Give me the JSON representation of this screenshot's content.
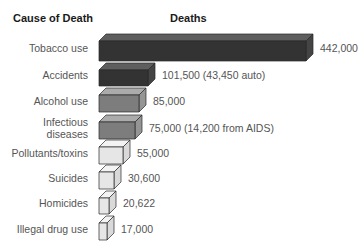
{
  "chart_data": {
    "type": "bar",
    "orientation": "horizontal",
    "style": "3d-box",
    "title": "",
    "column_headers": {
      "category": "Cause of Death",
      "value": "Deaths"
    },
    "categories": [
      "Tobacco use",
      "Accidents",
      "Alcohol use",
      "Infectious diseases",
      "Pollutants/toxins",
      "Suicides",
      "Homicides",
      "Illegal drug use"
    ],
    "values": [
      442000,
      101500,
      85000,
      75000,
      55000,
      30600,
      20622,
      17000
    ],
    "value_labels": [
      "442,000",
      "101,500 (43,450 auto)",
      "85,000",
      "75,000 (14,200 from AIDS)",
      "55,000",
      "30,600",
      "20,622",
      "17,000"
    ],
    "xlabel": "",
    "ylabel": "",
    "grid": false,
    "legend": null
  },
  "rows": [
    {
      "label_lines": [
        "Tobacco use"
      ],
      "value_label": "442,000",
      "front_x2": 306,
      "top": 41,
      "bottom": 61,
      "shade": "dark"
    },
    {
      "label_lines": [
        "Accidents"
      ],
      "value_label": "101,500 (43,450 auto)",
      "front_x2": 148,
      "top": 70,
      "bottom": 86,
      "shade": "dark"
    },
    {
      "label_lines": [
        "Alcohol use"
      ],
      "value_label": "85,000",
      "front_x2": 139,
      "top": 95,
      "bottom": 112,
      "shade": "mid"
    },
    {
      "label_lines": [
        "Infectious",
        "diseases"
      ],
      "value_label": "75,000 (14,200 from AIDS)",
      "front_x2": 135,
      "top": 122,
      "bottom": 139,
      "shade": "mid"
    },
    {
      "label_lines": [
        "Pollutants/toxins"
      ],
      "value_label": "55,000",
      "front_x2": 123,
      "top": 147,
      "bottom": 164,
      "shade": "light"
    },
    {
      "label_lines": [
        "Suicides"
      ],
      "value_label": "30,600",
      "front_x2": 114,
      "top": 172,
      "bottom": 189,
      "shade": "light"
    },
    {
      "label_lines": [
        "Homicides"
      ],
      "value_label": "20,622",
      "front_x2": 109,
      "top": 198,
      "bottom": 214,
      "shade": "light"
    },
    {
      "label_lines": [
        "Illegal drug use"
      ],
      "value_label": "17,000",
      "front_x2": 107,
      "top": 223,
      "bottom": 240,
      "shade": "light"
    }
  ],
  "colors": {
    "dark": {
      "front": "#333333",
      "top": "#5e5e5e",
      "side": "#444444"
    },
    "mid": {
      "front": "#7d7d7d",
      "top": "#ababab",
      "side": "#959595"
    },
    "light": {
      "front": "#e6e6e6",
      "top": "#f3f3f3",
      "side": "#d9d9d9"
    },
    "stroke": "#2a2a2a"
  }
}
